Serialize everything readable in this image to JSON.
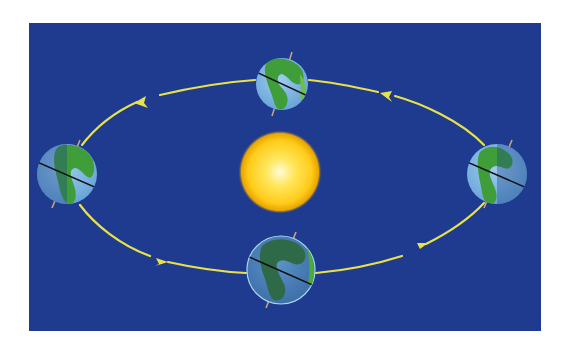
{
  "diagram": {
    "canvas": {
      "width": 570,
      "height": 356,
      "background": "#ffffff"
    },
    "panel": {
      "x": 29,
      "y": 23,
      "width": 512,
      "height": 308,
      "color": "#1f3b8f"
    },
    "sun": {
      "cx": 280,
      "cy": 172,
      "r": 40,
      "core_color": "#fffbd0",
      "mid_color": "#ffd21a",
      "edge_color": "#e8a800"
    },
    "orbit": {
      "cx": 281,
      "cy": 172,
      "rx": 213,
      "ry": 96,
      "color": "#e8e24a",
      "direction": "counter-clockwise",
      "stroke_width": 2.2
    },
    "arrows": [
      {
        "id": "top-left",
        "x": 142,
        "y": 100,
        "direction": "left"
      },
      {
        "id": "top-right",
        "x": 386,
        "y": 95,
        "direction": "left"
      },
      {
        "id": "bottom-left",
        "x": 163,
        "y": 259,
        "direction": "right"
      },
      {
        "id": "bottom-right",
        "x": 418,
        "y": 250,
        "direction": "right"
      }
    ],
    "earths": [
      {
        "id": "earth-top",
        "cx": 282,
        "cy": 84,
        "r": 26,
        "tilt_deg": 23.5,
        "lit_side": "full",
        "ocean": "#7fb8e0",
        "land": "#3f9e3a"
      },
      {
        "id": "earth-left",
        "cx": 67,
        "cy": 174,
        "r": 30,
        "tilt_deg": 23.5,
        "lit_side": "right",
        "ocean": "#7fb8e0",
        "land": "#3f9e3a"
      },
      {
        "id": "earth-right",
        "cx": 497,
        "cy": 174,
        "r": 30,
        "tilt_deg": 23.5,
        "lit_side": "left",
        "ocean": "#7fb8e0",
        "land": "#3f9e3a"
      },
      {
        "id": "earth-bottom",
        "cx": 281,
        "cy": 270,
        "r": 34,
        "tilt_deg": 23.5,
        "lit_side": "none",
        "ocean": "#4a80b8",
        "land": "#2f6e3a"
      }
    ],
    "axis_color": "#c9a27a",
    "equator_color": "#111111"
  }
}
